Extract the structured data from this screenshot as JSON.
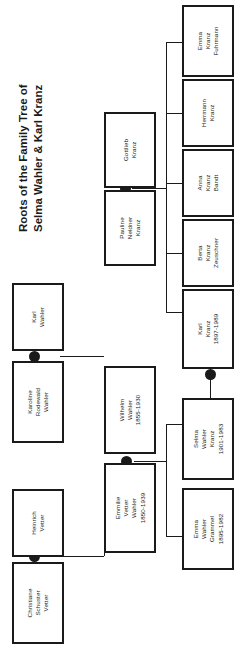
{
  "title": {
    "line1": "Roots of the Family Tree of",
    "line2": "Selma Wahler & Karl Kranz"
  },
  "people": {
    "gottlieb_kranz": {
      "l1": "Gottlieb",
      "l2": "Kranz",
      "l3": ""
    },
    "pauline_kranz": {
      "l1": "Pauline",
      "l2": "Neldner",
      "l3": "Kranz"
    },
    "emma_fuhrmann": {
      "l1": "Emma",
      "l2": "Kranz",
      "l3": "Fuhrmann"
    },
    "herrmann_kranz": {
      "l1": "Herrmann",
      "l2": "Kranz",
      "l3": ""
    },
    "anna_bandt": {
      "l1": "Anna",
      "l2": "Kranz",
      "l3": "Bandt"
    },
    "berta_zeuschner": {
      "l1": "Berta",
      "l2": "Kranz",
      "l3": "Zeuschner"
    },
    "karl_kranz": {
      "l1": "Karl",
      "l2": "Kranz",
      "l3": "1897-1989"
    },
    "selma_wahler": {
      "l1": "Selma",
      "l2": "Wahler",
      "l3": "Kranz",
      "l4": "1901-1983"
    },
    "emma_grammel": {
      "l1": "Emma",
      "l2": "Wahler",
      "l3": "Grammel",
      "l4": "1895-1982"
    },
    "wilhelm_wahler": {
      "l1": "Wilhelm",
      "l2": "Wahler",
      "l3": "1855-1930"
    },
    "emmilie_wahler": {
      "l1": "Emmilie",
      "l2": "Vetter",
      "l3": "Wahler",
      "l4": "1850-1939"
    },
    "karl_wahler": {
      "l1": "Karl",
      "l2": "Wahler",
      "l3": ""
    },
    "karoline_wahler": {
      "l1": "Karoline",
      "l2": "Rodewald",
      "l3": "Wahler"
    },
    "heinrich_vetter": {
      "l1": "Heinrich",
      "l2": "Vetter",
      "l3": ""
    },
    "christiane_vetter": {
      "l1": "Christiane",
      "l2": "Schuster",
      "l3": "Vetter"
    }
  },
  "colors": {
    "ink": "#1a1a1a",
    "background": "#ffffff"
  }
}
